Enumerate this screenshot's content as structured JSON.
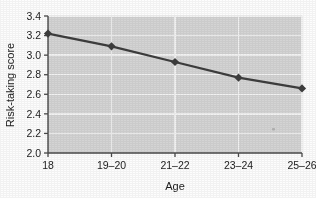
{
  "chart_data": {
    "type": "line",
    "title": "",
    "xlabel": "Age",
    "ylabel": "Risk-taking score",
    "categories": [
      "18",
      "19–20",
      "21–22",
      "23–24",
      "25–26"
    ],
    "values": [
      3.22,
      3.09,
      2.93,
      2.77,
      2.66
    ],
    "series": [
      {
        "name": "Risk-taking score",
        "values": [
          3.22,
          3.09,
          2.93,
          2.77,
          2.66
        ]
      }
    ],
    "ylim": [
      2.0,
      3.4
    ],
    "ytick_labels": [
      "2.0",
      "2.2",
      "2.4",
      "2.6",
      "2.8",
      "3.0",
      "3.2",
      "3.4"
    ],
    "ytick_values": [
      2.0,
      2.2,
      2.4,
      2.6,
      2.8,
      3.0,
      3.2,
      3.4
    ],
    "xtick_labels": [
      "18",
      "19–20",
      "21–22",
      "23–24",
      "25–26"
    ],
    "grid": "horizontal-and-vertical-white",
    "legend": "none",
    "marker": "diamond",
    "colors": {
      "line": "#3d3d3d",
      "marker": "#3d3d3d",
      "plot_background": "#d4d4d4",
      "gridline": "#f2f2f2",
      "axis": "#4a4a4a",
      "text": "#1c1c1c",
      "page_background": "#fdfdfd"
    }
  },
  "axes": {
    "y_title": "Risk-taking score",
    "x_title": "Age"
  }
}
